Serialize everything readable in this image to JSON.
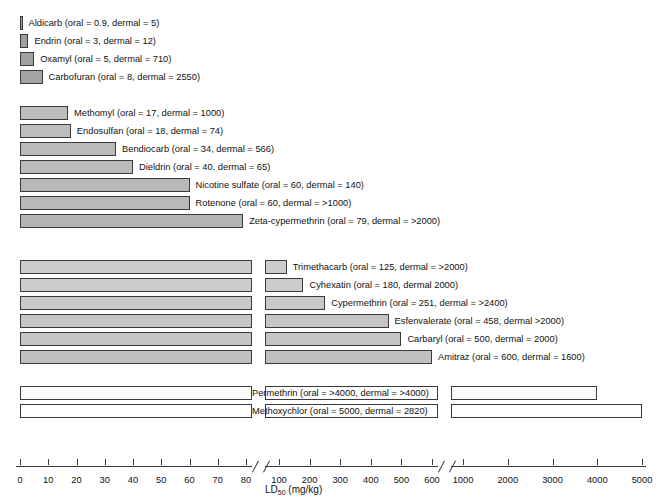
{
  "chart_data": {
    "type": "bar",
    "title": "",
    "xlabel": "LD50 (mg/kg)",
    "xlabel_main": "LD",
    "xlabel_sub": "50",
    "xlabel_units": " (mg/kg)",
    "orientation": "horizontal",
    "axis_break": true,
    "axis_segments": [
      {
        "ticks": [
          0,
          10,
          20,
          30,
          40,
          50,
          60,
          70,
          80
        ]
      },
      {
        "ticks": [
          100,
          200,
          300,
          400,
          500,
          600
        ]
      },
      {
        "ticks": [
          1000,
          2000,
          3000,
          4000,
          5000
        ]
      }
    ],
    "tick_labels": [
      "0",
      "10",
      "20",
      "30",
      "40",
      "50",
      "60",
      "70",
      "80",
      "100",
      "200",
      "300",
      "400",
      "500",
      "600",
      "1000",
      "2000",
      "3000",
      "4000",
      "5000"
    ],
    "categories": [
      "Aldicarb",
      "Endrin",
      "Oxamyl",
      "Carbofuran",
      "Methomyl",
      "Endosulfan",
      "Bendiocarb",
      "Dieldrin",
      "Nicotine sulfate",
      "Rotenone",
      "Zeta-cypermethrin",
      "Trimethacarb",
      "Cyhexatin",
      "Cypermethrin",
      "Esfenvalerate",
      "Carbaryl",
      "Amitraz",
      "Permethrin",
      "Methoxychlor"
    ],
    "values": [
      0.9,
      3,
      5,
      8,
      17,
      18,
      34,
      40,
      60,
      60,
      79,
      125,
      180,
      251,
      458,
      500,
      600,
      4000,
      5000
    ],
    "bars": [
      {
        "label": "Aldicarb (oral = 0.9, dermal = 5)",
        "name": "Aldicarb",
        "oral": "0.9",
        "dermal": "5",
        "fill": "#9b9b9b"
      },
      {
        "label": "Endrin (oral = 3, dermal = 12)",
        "name": "Endrin",
        "oral": "3",
        "dermal": "12",
        "fill": "#9e9e9e"
      },
      {
        "label": "Oxamyl (oral = 5, dermal = 710)",
        "name": "Oxamyl",
        "oral": "5",
        "dermal": "710",
        "fill": "#a1a1a1"
      },
      {
        "label": "Carbofuran (oral = 8, dermal = 2550)",
        "name": "Carbofuran",
        "oral": "8",
        "dermal": "2550",
        "fill": "#a4a4a4"
      },
      {
        "label": "Methomyl (oral = 17, dermal = 1000)",
        "name": "Methomyl",
        "oral": "17",
        "dermal": "1000",
        "fill": "#bdbdbd"
      },
      {
        "label": "Endosulfan (oral = 18, dermal = 74)",
        "name": "Endosulfan",
        "oral": "18",
        "dermal": "74",
        "fill": "#bdbdbd"
      },
      {
        "label": "Bendiocarb (oral = 34, dermal = 566)",
        "name": "Bendiocarb",
        "oral": "34",
        "dermal": "566",
        "fill": "#bbbbbb"
      },
      {
        "label": "Dieldrin (oral = 40, dermal = 65)",
        "name": "Dieldrin",
        "oral": "40",
        "dermal": "65",
        "fill": "#bbbbbb"
      },
      {
        "label": "Nicotine sulfate (oral = 60, dermal = 140)",
        "name": "Nicotine sulfate",
        "oral": "60",
        "dermal": "140",
        "fill": "#b8b8b8"
      },
      {
        "label": "Rotenone (oral = 60, dermal = >1000)",
        "name": "Rotenone",
        "oral": "60",
        "dermal": ">1000",
        "fill": "#b8b8b8"
      },
      {
        "label": "Zeta-cypermethrin (oral = 79, dermal = >2000)",
        "name": "Zeta-cypermethrin",
        "oral": "79",
        "dermal": ">2000",
        "fill": "#b5b5b5"
      },
      {
        "label": "Trimethacarb (oral = 125, dermal = >2000)",
        "name": "Trimethacarb",
        "oral": "125",
        "dermal": ">2000",
        "fill": "#cccccc"
      },
      {
        "label": "Cyhexatin (oral = 180, dermal 2000)",
        "name": "Cyhexatin",
        "oral": "180",
        "dermal": "2000",
        "fill": "#cccccc"
      },
      {
        "label": "Cypermethrin (oral = 251, dermal = >2400)",
        "name": "Cypermethrin",
        "oral": "251",
        "dermal": ">2400",
        "fill": "#c9c9c9"
      },
      {
        "label": "Esfenvalerate (oral = 458, dermal >2000)",
        "name": "Esfenvalerate",
        "oral": "458",
        "dermal": ">2000",
        "fill": "#c6c6c6"
      },
      {
        "label": "Carbaryl (oral = 500, dermal = 2000)",
        "name": "Carbaryl",
        "oral": "500",
        "dermal": "2000",
        "fill": "#c4c4c4"
      },
      {
        "label": "Amitraz (oral = 600, dermal = 1600)",
        "name": "Amitraz",
        "oral": "600",
        "dermal": "1600",
        "fill": "#c0c0c0"
      },
      {
        "label": "Permethrin (oral = >4000,   dermal = >4000)",
        "name": "Permethrin",
        "oral": ">4000",
        "dermal": ">4000",
        "fill": "#fdfdfd"
      },
      {
        "label": "Methoxychlor (oral = 5000,   dermal = 2820)",
        "name": "Methoxychlor",
        "oral": "5000",
        "dermal": "2820",
        "fill": "#ffffff"
      }
    ]
  },
  "colors": {
    "stroke": "#3a3a3a",
    "text": "#111111",
    "background": "#ffffff"
  }
}
